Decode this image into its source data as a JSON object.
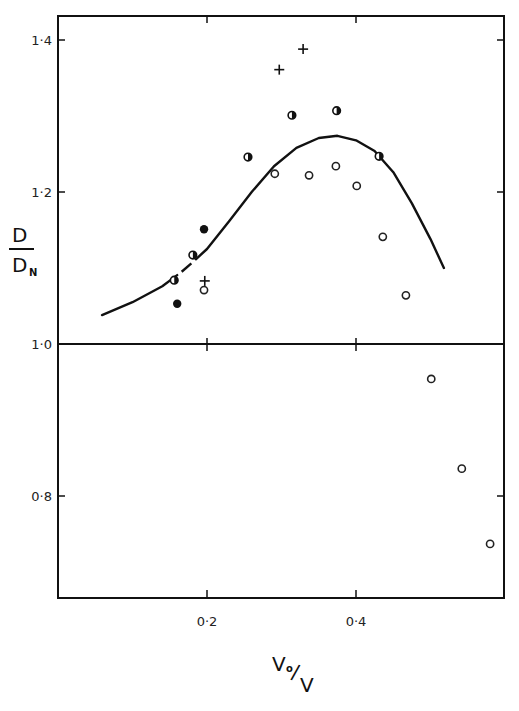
{
  "chart_data": {
    "type": "scatter",
    "title": "",
    "xlabel": "V0/V",
    "xlabel_parts": {
      "main": "V",
      "sub": "o",
      "slash": "/",
      "denom": "V"
    },
    "ylabel": "D/DN",
    "ylabel_parts": {
      "num": "D",
      "den": "D",
      "den_sub": "N"
    },
    "xlim": [
      0.0,
      0.6
    ],
    "ylim": [
      0.66,
      1.43
    ],
    "x_ticks": [
      0.2,
      0.4
    ],
    "x_tick_labels": [
      "0·2",
      "0·4"
    ],
    "y_ticks": [
      0.8,
      1.0,
      1.2,
      1.4
    ],
    "y_tick_labels": [
      "0·8",
      "1·0",
      "1·2",
      "1·4"
    ],
    "reference_line": {
      "y": 1.0,
      "style": "solid",
      "full_width": true
    },
    "grid": false,
    "legend": null,
    "series": [
      {
        "name": "open circles",
        "marker": "open-circle",
        "points": [
          {
            "x": 0.196,
            "y": 1.071
          },
          {
            "x": 0.291,
            "y": 1.224
          },
          {
            "x": 0.337,
            "y": 1.222
          },
          {
            "x": 0.373,
            "y": 1.234
          },
          {
            "x": 0.401,
            "y": 1.208
          },
          {
            "x": 0.436,
            "y": 1.141
          },
          {
            "x": 0.467,
            "y": 1.064
          },
          {
            "x": 0.501,
            "y": 0.954
          },
          {
            "x": 0.542,
            "y": 0.836
          },
          {
            "x": 0.58,
            "y": 0.737
          }
        ]
      },
      {
        "name": "half-filled circles",
        "marker": "half-filled-circle",
        "points": [
          {
            "x": 0.156,
            "y": 1.084
          },
          {
            "x": 0.181,
            "y": 1.117
          },
          {
            "x": 0.255,
            "y": 1.246
          },
          {
            "x": 0.314,
            "y": 1.301
          },
          {
            "x": 0.374,
            "y": 1.307
          },
          {
            "x": 0.431,
            "y": 1.247
          }
        ]
      },
      {
        "name": "filled circles",
        "marker": "filled-circle",
        "points": [
          {
            "x": 0.16,
            "y": 1.053
          },
          {
            "x": 0.196,
            "y": 1.151
          }
        ]
      },
      {
        "name": "crosses",
        "marker": "plus",
        "points": [
          {
            "x": 0.197,
            "y": 1.083
          },
          {
            "x": 0.297,
            "y": 1.361
          },
          {
            "x": 0.329,
            "y": 1.388
          }
        ]
      }
    ],
    "fit_curve": {
      "name": "fitted curve",
      "style": "solid",
      "points": [
        {
          "x": 0.059,
          "y": 1.038
        },
        {
          "x": 0.1,
          "y": 1.055
        },
        {
          "x": 0.14,
          "y": 1.076
        },
        {
          "x": 0.17,
          "y": 1.098
        },
        {
          "x": 0.2,
          "y": 1.125
        },
        {
          "x": 0.23,
          "y": 1.162
        },
        {
          "x": 0.26,
          "y": 1.2
        },
        {
          "x": 0.29,
          "y": 1.234
        },
        {
          "x": 0.32,
          "y": 1.258
        },
        {
          "x": 0.35,
          "y": 1.271
        },
        {
          "x": 0.375,
          "y": 1.274
        },
        {
          "x": 0.4,
          "y": 1.268
        },
        {
          "x": 0.425,
          "y": 1.254
        },
        {
          "x": 0.45,
          "y": 1.226
        },
        {
          "x": 0.475,
          "y": 1.185
        },
        {
          "x": 0.5,
          "y": 1.138
        },
        {
          "x": 0.518,
          "y": 1.1
        }
      ],
      "gap_between_x": [
        0.16,
        0.185
      ]
    }
  },
  "plot_area_px": {
    "left": 58,
    "right": 504,
    "top": 16,
    "bottom": 598
  }
}
